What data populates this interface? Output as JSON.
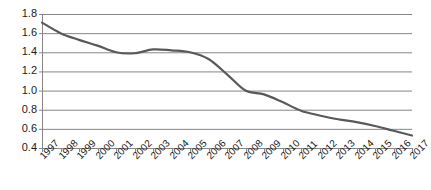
{
  "chart_data": {
    "type": "line",
    "title": "",
    "subtitle": "",
    "xlabel": "",
    "ylabel": "",
    "categories": [
      "1997",
      "1998",
      "1999",
      "2000",
      "2001",
      "2002",
      "2003",
      "2004",
      "2005",
      "2006",
      "2007",
      "2008",
      "2009",
      "2010",
      "2011",
      "2012",
      "2013",
      "2014",
      "2015",
      "2016",
      "2017"
    ],
    "values": [
      1.71,
      1.6,
      1.53,
      1.47,
      1.4,
      1.39,
      1.43,
      1.42,
      1.4,
      1.33,
      1.17,
      1.0,
      0.96,
      0.88,
      0.79,
      0.74,
      0.7,
      0.67,
      0.63,
      0.58,
      0.53
    ],
    "series": [
      {
        "name": "series-1",
        "values": [
          1.71,
          1.6,
          1.53,
          1.47,
          1.4,
          1.39,
          1.43,
          1.42,
          1.4,
          1.33,
          1.17,
          1.0,
          0.96,
          0.88,
          0.79,
          0.74,
          0.7,
          0.67,
          0.63,
          0.58,
          0.53
        ]
      }
    ],
    "ylim": [
      0.4,
      1.8
    ],
    "ytick_labels": [
      "0.4",
      "0.6",
      "0.8",
      "1.0",
      "1.2",
      "1.4",
      "1.6",
      "1.8"
    ],
    "ytick_values": [
      0.4,
      0.6,
      0.8,
      1.0,
      1.2,
      1.4,
      1.6,
      1.8
    ],
    "grid": "horizontal",
    "legend": "none",
    "line_color": "#595959",
    "gridline_color": "#868686",
    "axis_color": "#868686",
    "background_color": "#ffffff",
    "xtick_rotation": -45
  }
}
